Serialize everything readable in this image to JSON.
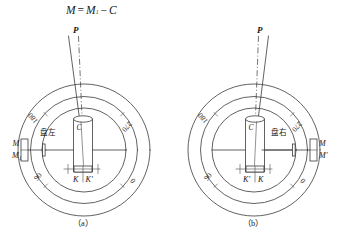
{
  "figure": {
    "title_formula": {
      "lhs": "M",
      "equals": "=",
      "rhs_term": "M",
      "rhs_sub": "1",
      "minus": "−",
      "correction": "C"
    },
    "panels": [
      {
        "id": "panel-a",
        "caption": "（a）",
        "position_label": "盘左",
        "target_label": "P",
        "center_label": "C",
        "dial_ticks": [
          "180",
          "270",
          "90",
          "0"
        ],
        "index_marks": [
          "K",
          "K′"
        ],
        "reading_labels": [
          "M",
          "M₁"
        ],
        "reading_side": "left"
      },
      {
        "id": "panel-b",
        "caption": "（b）",
        "position_label": "盘右",
        "target_label": "P",
        "center_label": "C",
        "dial_ticks": [
          "180",
          "270",
          "90",
          "0"
        ],
        "index_marks": [
          "K′",
          "K"
        ],
        "reading_labels": [
          "M",
          "M′"
        ],
        "reading_side": "right"
      }
    ],
    "colors": {
      "background": "#ffffff",
      "ink": "#3a3a3a",
      "text": "#1a1a1a"
    }
  }
}
